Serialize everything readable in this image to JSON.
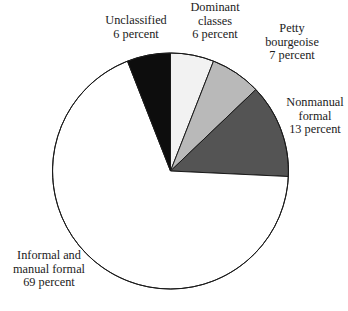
{
  "chart_data": {
    "type": "pie",
    "title": "",
    "subtitle": "",
    "xlabel": "",
    "ylabel": "",
    "legend_position": "none",
    "grid": false,
    "unit": "percent",
    "start_angle_deg": 0,
    "direction": "clockwise",
    "categories": [
      "Dominant classes",
      "Petty bourgeoise",
      "Nonmanual formal",
      "Informal and manual formal",
      "Unclassified"
    ],
    "values": [
      6,
      7,
      13,
      69,
      6
    ],
    "slices": [
      {
        "name": "dominant-classes",
        "label_lines": [
          "Dominant",
          "classes",
          "6 percent"
        ],
        "value": 6,
        "value_text": "6 percent",
        "color": "#f2f2f2",
        "stroke": "#1a1a1a"
      },
      {
        "name": "petty-bourgeoise",
        "label_lines": [
          "Petty",
          "bourgeoise",
          "7 percent"
        ],
        "value": 7,
        "value_text": "7 percent",
        "color": "#b9b9b9",
        "stroke": "#1a1a1a"
      },
      {
        "name": "nonmanual-formal",
        "label_lines": [
          "Nonmanual",
          "formal",
          "13 percent"
        ],
        "value": 13,
        "value_text": "13 percent",
        "color": "#545454",
        "stroke": "#1a1a1a"
      },
      {
        "name": "informal-and-manual-formal",
        "label_lines": [
          "Informal and",
          "manual formal",
          "69 percent"
        ],
        "value": 69,
        "value_text": "69 percent",
        "color": "#ffffff",
        "stroke": "#1a1a1a"
      },
      {
        "name": "unclassified",
        "label_lines": [
          "Unclassified",
          "6 percent"
        ],
        "value": 6,
        "value_text": "6 percent",
        "color": "#0d0d0d",
        "stroke": "#1a1a1a"
      }
    ],
    "geometry": {
      "center_x": 170.5,
      "center_y": 171,
      "radius": 118
    }
  }
}
